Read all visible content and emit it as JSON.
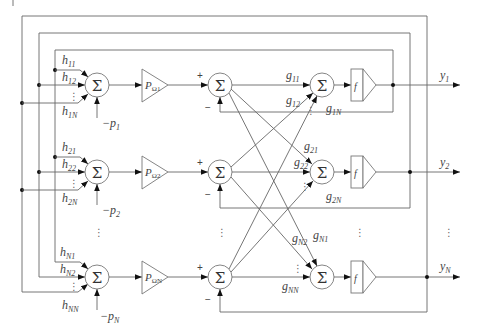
{
  "diagram": {
    "type": "block-diagram",
    "rows": [
      {
        "index": "1",
        "input_weights": [
          "h11",
          "h12",
          "h1N"
        ],
        "input_weight_labels": {
          "a": {
            "main": "h",
            "sub": "11"
          },
          "b": {
            "main": "h",
            "sub": "12"
          },
          "c": {
            "main": "h",
            "sub": "1N"
          }
        },
        "bias": {
          "main": "−p",
          "sub": "1"
        },
        "gain": {
          "main": "P",
          "sub": "Ω1"
        },
        "output_weights": {
          "a": {
            "main": "g",
            "sub": "11"
          },
          "b": {
            "main": "g",
            "sub": "12"
          },
          "c": {
            "main": "g",
            "sub": "1N"
          }
        },
        "function": "f",
        "output": {
          "main": "y",
          "sub": "1"
        }
      },
      {
        "index": "2",
        "input_weights": [
          "h21",
          "h22",
          "h2N"
        ],
        "input_weight_labels": {
          "a": {
            "main": "h",
            "sub": "21"
          },
          "b": {
            "main": "h",
            "sub": "22"
          },
          "c": {
            "main": "h",
            "sub": "2N"
          }
        },
        "bias": {
          "main": "−p",
          "sub": "2"
        },
        "gain": {
          "main": "P",
          "sub": "Ω2"
        },
        "output_weights": {
          "a": {
            "main": "g",
            "sub": "21"
          },
          "b": {
            "main": "g",
            "sub": "22"
          },
          "c": {
            "main": "g",
            "sub": "2N"
          }
        },
        "function": "f",
        "output": {
          "main": "y",
          "sub": "2"
        }
      },
      {
        "index": "N",
        "input_weights": [
          "hN1",
          "hN2",
          "hNN"
        ],
        "input_weight_labels": {
          "a": {
            "main": "h",
            "sub": "N1"
          },
          "b": {
            "main": "h",
            "sub": "N2"
          },
          "c": {
            "main": "h",
            "sub": "NN"
          }
        },
        "bias": {
          "main": "−p",
          "sub": "N"
        },
        "gain": {
          "main": "P",
          "sub": "ΩN"
        },
        "output_weights": {
          "a": {
            "main": "g",
            "sub": "N1"
          },
          "b": {
            "main": "g",
            "sub": "N2"
          },
          "c": {
            "main": "g",
            "sub": "NN"
          }
        },
        "function": "f",
        "output": {
          "main": "y",
          "sub": "N"
        }
      }
    ],
    "symbols": {
      "sum": "Σ",
      "plus": "+",
      "minus": "−",
      "vdots": "⋮"
    }
  }
}
